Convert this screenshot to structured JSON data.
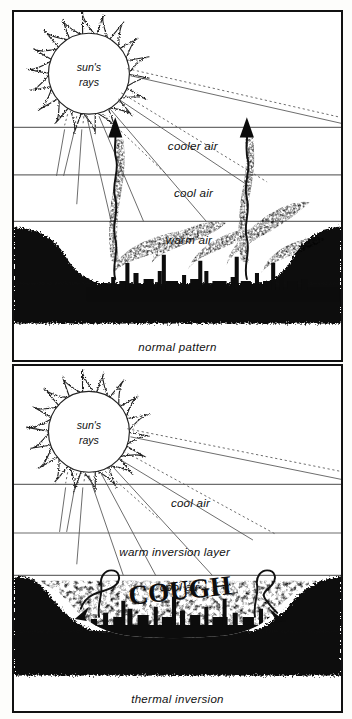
{
  "figure": {
    "title_implied": "Normal pattern vs thermal inversion",
    "colors": {
      "ink": "#111111",
      "paper": "#ffffff",
      "ground": "#0c0c0c",
      "layer_rule": "#6d6d6d"
    }
  },
  "panels": [
    {
      "id": "normal",
      "caption": "normal pattern",
      "sun": {
        "label_line1": "sun's",
        "label_line2": "rays",
        "points": 18
      },
      "layers": [
        {
          "label": "cooler air"
        },
        {
          "label": "cool air"
        },
        {
          "label": "warm air"
        }
      ],
      "annotations": {
        "smoke_direction": "rising",
        "arrows": 2
      }
    },
    {
      "id": "inversion",
      "caption": "thermal inversion",
      "sun": {
        "label_line1": "sun's",
        "label_line2": "rays",
        "points": 18
      },
      "layers": [
        {
          "label": "cool air"
        },
        {
          "label": "warm inversion layer"
        },
        {
          "label": "cool air"
        }
      ],
      "annotations": {
        "smog_word": "COUGH",
        "smoke_direction": "trapped",
        "arrows": 2
      }
    }
  ]
}
